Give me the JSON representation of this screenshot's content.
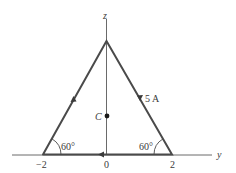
{
  "figure": {
    "axes": {
      "horizontal_label": "y",
      "vertical_label": "z"
    },
    "ticks": {
      "left": "−2",
      "origin": "0",
      "right": "2"
    },
    "angles": {
      "left": "60°",
      "right": "60°"
    },
    "current_label": "5 A",
    "point_label": "C",
    "colors": {
      "wire": "#4a4a4a",
      "axis": "#6a6a6a",
      "text": "#3a3a3a",
      "background": "#ffffff"
    }
  }
}
